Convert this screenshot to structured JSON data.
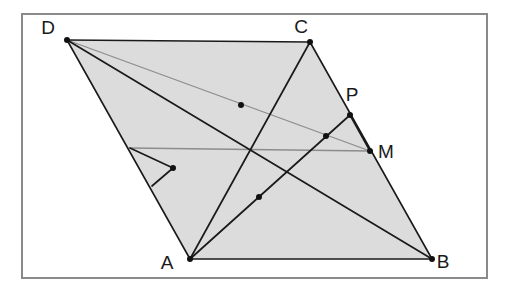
{
  "figure": {
    "canvas": {
      "width": 511,
      "height": 295,
      "background": "#ffffff"
    },
    "frame": {
      "x": 21,
      "y": 13,
      "width": 466,
      "height": 265,
      "stroke": "#8a8a8a",
      "stroke_width": 2
    },
    "colors": {
      "fill": "#dcdcdc",
      "line": "#1a1a1a",
      "faint_line": "#8c8c8c",
      "frame": "#8a8a8a",
      "dot": "#111111",
      "label": "#1a1a1a"
    },
    "vertices": [
      {
        "name": "D",
        "label": "D",
        "x": 67,
        "y": 40,
        "label_x": 48,
        "label_y": 34
      },
      {
        "name": "C",
        "label": "C",
        "x": 310,
        "y": 42,
        "label_x": 301,
        "label_y": 33
      },
      {
        "name": "B",
        "label": "B",
        "x": 432,
        "y": 259,
        "label_x": 443,
        "label_y": 268
      },
      {
        "name": "A",
        "label": "A",
        "x": 190,
        "y": 259,
        "label_x": 167,
        "label_y": 269
      }
    ],
    "marked_points": [
      {
        "name": "P",
        "label": "P",
        "x": 350,
        "y": 115,
        "label_x": 348,
        "label_y": 101
      },
      {
        "name": "M",
        "label": "M",
        "x": 370,
        "y": 151,
        "label_x": 380,
        "label_y": 158
      }
    ],
    "intersection_points": [
      {
        "name": "i1",
        "x": 241,
        "y": 105
      },
      {
        "name": "i2",
        "x": 326,
        "y": 136
      },
      {
        "name": "i3",
        "x": 173,
        "y": 168
      },
      {
        "name": "i4",
        "x": 259,
        "y": 197
      }
    ],
    "edge_points": [
      {
        "name": "e1",
        "x": 130,
        "y": 148
      },
      {
        "name": "e2",
        "x": 152,
        "y": 186
      }
    ],
    "polygon_points": "67,40 310,42 432,259 190,259",
    "segments": [
      {
        "name": "side-DC",
        "x1": 67,
        "y1": 40,
        "x2": 310,
        "y2": 42,
        "style": "edge"
      },
      {
        "name": "side-CB",
        "x1": 310,
        "y1": 42,
        "x2": 432,
        "y2": 259,
        "style": "edge"
      },
      {
        "name": "side-AB",
        "x1": 190,
        "y1": 259,
        "x2": 432,
        "y2": 259,
        "style": "edge"
      },
      {
        "name": "side-DA",
        "x1": 67,
        "y1": 40,
        "x2": 190,
        "y2": 259,
        "style": "edge"
      },
      {
        "name": "diagonal-DB",
        "x1": 67,
        "y1": 40,
        "x2": 432,
        "y2": 259,
        "style": "cevian"
      },
      {
        "name": "cevian-A-to-C",
        "x1": 190,
        "y1": 259,
        "x2": 310,
        "y2": 42,
        "style": "cevian"
      },
      {
        "name": "cevian-A-to-P",
        "x1": 190,
        "y1": 259,
        "x2": 350,
        "y2": 115,
        "style": "cevian"
      },
      {
        "name": "segment-P-to-M",
        "x1": 350,
        "y1": 115,
        "x2": 370,
        "y2": 151,
        "style": "cevian"
      },
      {
        "name": "segment-edge-to-i3",
        "x1": 130,
        "y1": 148,
        "x2": 173,
        "y2": 168,
        "style": "cevian"
      },
      {
        "name": "segment-i3-to-edge",
        "x1": 173,
        "y1": 168,
        "x2": 152,
        "y2": 186,
        "style": "cevian"
      },
      {
        "name": "faint-D-to-M",
        "x1": 67,
        "y1": 40,
        "x2": 370,
        "y2": 151,
        "style": "faint"
      },
      {
        "name": "faint-i3-to-M",
        "x1": 130,
        "y1": 148,
        "x2": 370,
        "y2": 151,
        "style": "faint"
      }
    ]
  }
}
